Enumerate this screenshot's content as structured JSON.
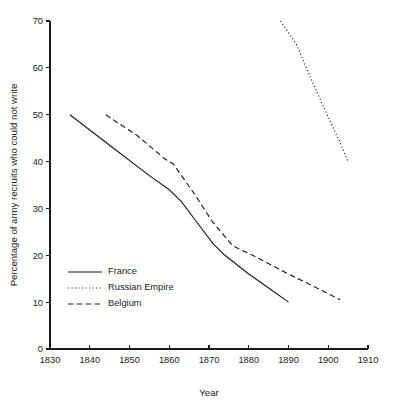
{
  "chart_data": {
    "type": "line",
    "title": "",
    "xlabel": "Year",
    "ylabel": "Percentage of army recruits who could not write",
    "xlim": [
      1830,
      1910
    ],
    "ylim": [
      0,
      70
    ],
    "xticks": [
      1830,
      1840,
      1850,
      1860,
      1870,
      1880,
      1890,
      1900,
      1910
    ],
    "yticks": [
      0,
      10,
      20,
      30,
      40,
      50,
      60,
      70
    ],
    "xtick_labels": [
      "1830",
      "1840",
      "1850",
      "1860",
      "1870",
      "1880",
      "1890",
      "1900",
      "1910"
    ],
    "ytick_labels": [
      "0",
      "10",
      "20",
      "30",
      "40",
      "50",
      "60",
      "70"
    ],
    "grid": false,
    "legend_position": "lower-left",
    "series": [
      {
        "name": "France",
        "style": "solid",
        "color": "#1a1a1a",
        "points": [
          [
            1835,
            50.0
          ],
          [
            1845,
            43.5
          ],
          [
            1855,
            37.0
          ],
          [
            1860,
            34.0
          ],
          [
            1863,
            31.5
          ],
          [
            1867,
            27.0
          ],
          [
            1871,
            22.5
          ],
          [
            1874,
            20.0
          ],
          [
            1880,
            16.0
          ],
          [
            1885,
            13.0
          ],
          [
            1890,
            10.0
          ]
        ]
      },
      {
        "name": "Russian Empire",
        "style": "dotted",
        "color": "#1a1a1a",
        "points": [
          [
            1888,
            70.0
          ],
          [
            1892,
            65.0
          ],
          [
            1896,
            57.0
          ],
          [
            1900,
            49.5
          ],
          [
            1903,
            44.0
          ],
          [
            1905,
            40.0
          ]
        ]
      },
      {
        "name": "Belgium",
        "style": "dashed",
        "color": "#1a1a1a",
        "points": [
          [
            1844,
            50.0
          ],
          [
            1852,
            45.5
          ],
          [
            1859,
            40.5
          ],
          [
            1861,
            39.5
          ],
          [
            1866,
            33.5
          ],
          [
            1871,
            27.0
          ],
          [
            1876,
            22.0
          ],
          [
            1881,
            20.0
          ],
          [
            1890,
            16.0
          ],
          [
            1896,
            13.5
          ],
          [
            1903,
            10.5
          ]
        ]
      }
    ],
    "legend_entries": [
      {
        "label": "France",
        "style": "solid"
      },
      {
        "label": "Russian Empire",
        "style": "dotted"
      },
      {
        "label": "Belgium",
        "style": "dashed"
      }
    ]
  }
}
